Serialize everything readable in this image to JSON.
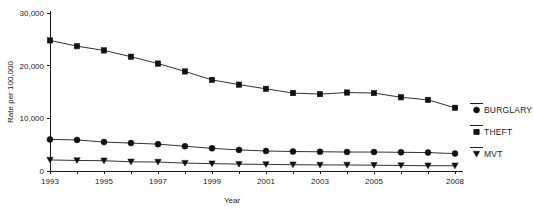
{
  "chart_data": {
    "type": "line",
    "title": "",
    "xlabel": "Year",
    "ylabel": "Rate per 100,000",
    "x": [
      1993,
      1994,
      1995,
      1996,
      1997,
      1998,
      1999,
      2000,
      2001,
      2002,
      2003,
      2004,
      2005,
      2006,
      2007,
      2008
    ],
    "xlim": [
      1993,
      2008
    ],
    "ylim": [
      0,
      30000
    ],
    "yticks": [
      0,
      10000,
      20000,
      30000
    ],
    "ytick_labels": [
      "0",
      "10,000",
      "20,000",
      "30,000"
    ],
    "xticks": [
      1993,
      1994,
      1995,
      1996,
      1997,
      1998,
      1999,
      2000,
      2001,
      2002,
      2003,
      2004,
      2005,
      2006,
      2007,
      2008
    ],
    "xtick_labels": [
      "1993",
      "",
      "1995",
      "",
      "1997",
      "",
      "1999",
      "",
      "2001",
      "",
      "2003",
      "",
      "2005",
      "",
      "",
      "2008"
    ],
    "grid": false,
    "legend_position": "right",
    "series": [
      {
        "name": "THEFT",
        "marker": "square",
        "values": [
          24800,
          23700,
          22900,
          21700,
          20400,
          18900,
          17300,
          16400,
          15600,
          14800,
          14600,
          14900,
          14800,
          14000,
          13500,
          12000
        ]
      },
      {
        "name": "BURGLARY",
        "marker": "circle",
        "values": [
          6000,
          5900,
          5500,
          5300,
          5100,
          4700,
          4300,
          4000,
          3800,
          3700,
          3650,
          3600,
          3600,
          3550,
          3500,
          3300
        ]
      },
      {
        "name": "MVT",
        "marker": "triangle",
        "values": [
          2100,
          2000,
          1950,
          1750,
          1700,
          1500,
          1400,
          1300,
          1250,
          1200,
          1150,
          1150,
          1100,
          1050,
          1000,
          1000
        ]
      }
    ]
  },
  "legend": {
    "items": [
      {
        "label": "BURGLARY",
        "marker": "circle"
      },
      {
        "label": "THEFT",
        "marker": "square"
      },
      {
        "label": "MVT",
        "marker": "triangle"
      }
    ]
  },
  "axes": {
    "y_title": "Rate per 100,000",
    "x_title": "Year"
  }
}
